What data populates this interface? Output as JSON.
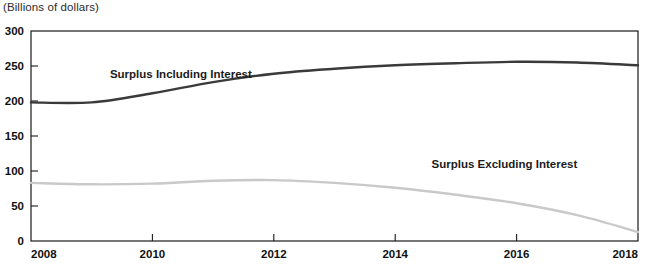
{
  "figure": {
    "unit_title": "(Billions of dollars)",
    "source_note": ""
  },
  "chart_data": {
    "type": "line",
    "title": "",
    "subtitle": "",
    "xlabel": "",
    "ylabel": "(Billions of dollars)",
    "xlim": [
      2008,
      2018
    ],
    "ylim": [
      0,
      300
    ],
    "xticks": [
      2008,
      2010,
      2012,
      2014,
      2016,
      2018
    ],
    "yticks": [
      0,
      50,
      100,
      150,
      200,
      250,
      300
    ],
    "xtick_labels": [
      "2008",
      "2010",
      "2012",
      "2014",
      "2016",
      "2018"
    ],
    "ytick_labels": [
      "0",
      "50",
      "100",
      "150",
      "200",
      "250",
      "300"
    ],
    "grid": false,
    "legend_position": "inline-annotations",
    "x": [
      2008,
      2009,
      2010,
      2011,
      2012,
      2013,
      2014,
      2015,
      2016,
      2017,
      2018
    ],
    "series": [
      {
        "name": "Surplus Including Interest",
        "color": "#3a3a3a",
        "width": 2.4,
        "values": [
          198,
          198,
          211,
          227,
          239,
          246,
          251,
          254,
          256,
          255,
          251
        ],
        "label_x": 2009.3,
        "label_y": 233
      },
      {
        "name": "Surplus Excluding Interest",
        "color": "#c9c9c9",
        "width": 2.4,
        "values": [
          83,
          81,
          82,
          86,
          87,
          83,
          76,
          66,
          54,
          37,
          13
        ],
        "label_x": 2014.6,
        "label_y": 104
      }
    ]
  }
}
